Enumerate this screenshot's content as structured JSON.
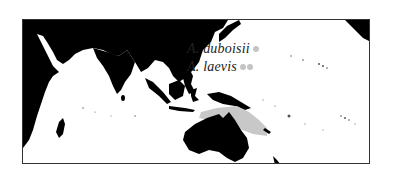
{
  "figure": {
    "type": "distribution-map",
    "region": "Indo-Pacific",
    "colors": {
      "land": "#000000",
      "ocean": "#ffffff",
      "range_fill": "#c8c8c8",
      "legend_dot": "#c4c4c4",
      "border": "#333333"
    }
  },
  "legend": {
    "items": [
      {
        "label": "A. duboisii",
        "dots": 1
      },
      {
        "label": "A. laevis",
        "dots": 2
      }
    ]
  }
}
